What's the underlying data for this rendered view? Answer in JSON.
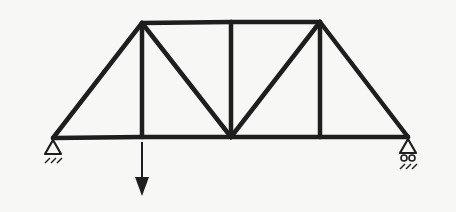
{
  "diagram": {
    "type": "truss",
    "colors": {
      "member": "#1e1e1e",
      "background": "#f7f7f5"
    },
    "nodes": [
      {
        "id": "A",
        "x": 53,
        "y": 138,
        "role": "bottom-left support (pin)"
      },
      {
        "id": "B",
        "x": 142,
        "y": 137,
        "role": "bottom panel point"
      },
      {
        "id": "C",
        "x": 231,
        "y": 137,
        "role": "bottom center panel point"
      },
      {
        "id": "D",
        "x": 320,
        "y": 137,
        "role": "bottom panel point"
      },
      {
        "id": "E",
        "x": 408,
        "y": 137,
        "role": "bottom-right support (roller)"
      },
      {
        "id": "F",
        "x": 142,
        "y": 23,
        "role": "top-left node"
      },
      {
        "id": "G",
        "x": 231,
        "y": 22,
        "role": "top center node"
      },
      {
        "id": "H",
        "x": 320,
        "y": 22,
        "role": "top-right node"
      }
    ],
    "members": [
      [
        "A",
        "B"
      ],
      [
        "B",
        "C"
      ],
      [
        "C",
        "D"
      ],
      [
        "D",
        "E"
      ],
      [
        "F",
        "G"
      ],
      [
        "G",
        "H"
      ],
      [
        "A",
        "F"
      ],
      [
        "F",
        "B"
      ],
      [
        "F",
        "C"
      ],
      [
        "G",
        "C"
      ],
      [
        "C",
        "H"
      ],
      [
        "H",
        "D"
      ],
      [
        "H",
        "E"
      ]
    ],
    "supports": [
      {
        "node": "A",
        "kind": "pin"
      },
      {
        "node": "E",
        "kind": "roller"
      }
    ],
    "loads": [
      {
        "node": "B",
        "direction": "down",
        "label": ""
      }
    ]
  }
}
